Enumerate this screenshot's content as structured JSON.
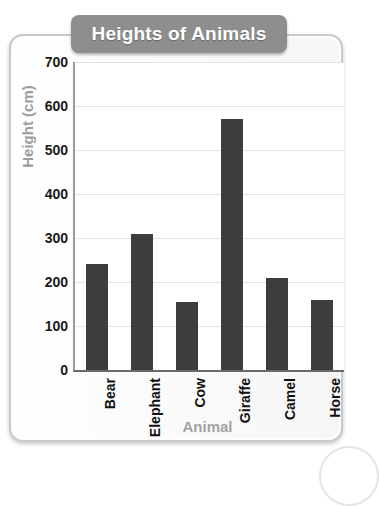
{
  "chart_data": {
    "type": "bar",
    "title": "Heights of Animals",
    "xlabel": "Animal",
    "ylabel": "Height (cm)",
    "categories": [
      "Bear",
      "Elephant",
      "Cow",
      "Giraffe",
      "Camel",
      "Horse"
    ],
    "values": [
      240,
      310,
      155,
      570,
      208,
      160
    ],
    "ylim": [
      0,
      700
    ],
    "ytick_step": 100,
    "yticks": [
      "0",
      "100",
      "200",
      "300",
      "400",
      "500",
      "600",
      "700"
    ],
    "grid": true,
    "legend": "none",
    "bar_color": "#3d3d3d",
    "title_badge_color": "#8e8e8e",
    "axis_title_color": "#9d9d9d",
    "gridline_color": "#e3e3e3",
    "plot_background": "#ffffff",
    "card_border_color": "#c9c9c9"
  }
}
